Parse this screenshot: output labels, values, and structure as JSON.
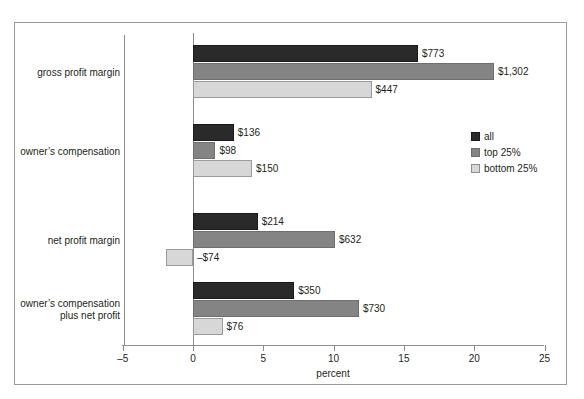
{
  "chart_data": {
    "type": "bar",
    "orientation": "horizontal",
    "title": "",
    "xlabel": "percent",
    "ylabel": "",
    "xlim": [
      -5,
      25
    ],
    "xticks": [
      -5,
      0,
      5,
      10,
      15,
      20,
      25
    ],
    "xtick_labels": [
      "–5",
      "0",
      "5",
      "10",
      "15",
      "20",
      "25"
    ],
    "grid": false,
    "legend_position": "center-right",
    "categories": [
      "gross profit margin",
      "owner’s compensation",
      "net profit margin",
      "owner’s compensation plus net profit"
    ],
    "series": [
      {
        "name": "all",
        "color": "#2a2a2a",
        "values": [
          16.0,
          2.9,
          4.6,
          7.2
        ],
        "data_labels": [
          "$773",
          "$136",
          "$214",
          "$350"
        ]
      },
      {
        "name": "top 25%",
        "color": "#848484",
        "values": [
          21.4,
          1.6,
          10.1,
          11.8
        ],
        "data_labels": [
          "$1,302",
          "$98",
          "$632",
          "$730"
        ]
      },
      {
        "name": "bottom 25%",
        "color": "#d7d7d7",
        "values": [
          12.7,
          4.2,
          -1.9,
          2.1
        ],
        "data_labels": [
          "$447",
          "$150",
          "–$74",
          "$76"
        ]
      }
    ]
  },
  "categories_display": [
    {
      "lines": [
        "gross profit margin"
      ]
    },
    {
      "lines": [
        "owner’s compensation"
      ]
    },
    {
      "lines": [
        "net profit margin"
      ]
    },
    {
      "lines": [
        "owner’s compensation",
        "plus net profit"
      ]
    }
  ],
  "axis": {
    "x_title": "percent",
    "tick_labels": [
      "–5",
      "0",
      "5",
      "10",
      "15",
      "20",
      "25"
    ]
  },
  "legend": {
    "items": [
      {
        "label": "all",
        "swatch": "legend-swatch-all"
      },
      {
        "label": "top 25%",
        "swatch": "legend-swatch-top-25"
      },
      {
        "label": "bottom 25%",
        "swatch": "legend-swatch-bottom-25"
      }
    ]
  },
  "colors": {
    "series_all": "#2a2a2a",
    "series_top25": "#848484",
    "series_bottom25": "#d7d7d7",
    "axis": "#8d8d8d",
    "frame": "#9a9a9a",
    "text": "#231f20",
    "background": "#ffffff"
  }
}
